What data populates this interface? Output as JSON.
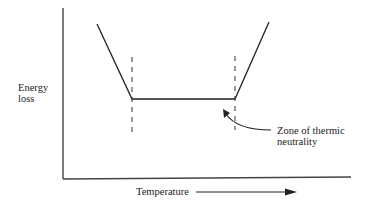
{
  "diagram": {
    "y_axis_label_line1": "Energy",
    "y_axis_label_line2": "loss",
    "x_axis_label": "Temperature",
    "annotation_line1": "Zone of thermic",
    "annotation_line2": "neutrality",
    "line_color": "#222222"
  },
  "curve": {
    "description": "Energy loss vs temperature: decreasing, flat plateau (zone of thermic neutrality), then increasing",
    "points": [
      [
        97,
        24
      ],
      [
        132,
        99
      ],
      [
        235,
        99
      ],
      [
        269,
        22
      ]
    ],
    "lower_critical_boundary_x": 132,
    "upper_critical_boundary_x": 235
  }
}
